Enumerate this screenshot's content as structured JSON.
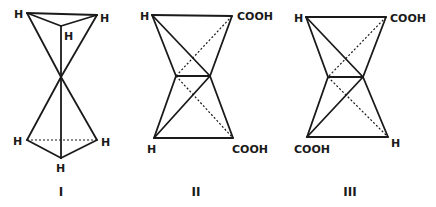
{
  "figures": [
    {
      "id": "I",
      "caption": "I",
      "labels": [
        "H",
        "H",
        "H",
        "H",
        "H",
        "H"
      ],
      "description": "Two triangles of H atoms joined apex-to-apex at a central point"
    },
    {
      "id": "II",
      "caption": "II",
      "labels": {
        "top_left": "H",
        "top_right": "COOH",
        "bottom_left": "H",
        "bottom_right": "COOH"
      }
    },
    {
      "id": "III",
      "caption": "III",
      "labels": {
        "top_left": "H",
        "top_right": "COOH",
        "bottom_left": "COOH",
        "bottom_right": "H"
      }
    }
  ],
  "colors": {
    "ink": "#1a1a1a",
    "background": "#ffffff"
  }
}
